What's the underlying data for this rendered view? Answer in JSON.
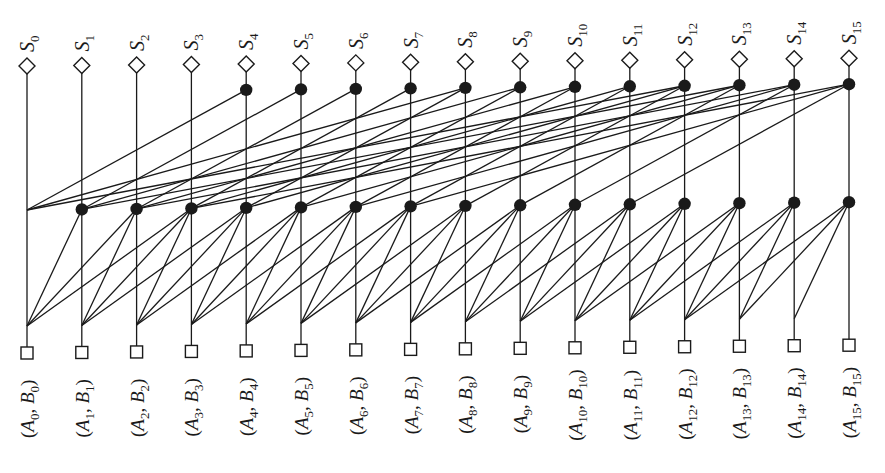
{
  "diagram": {
    "bit_count": 16,
    "layout": {
      "col_x0": 27,
      "col_dx": 54.8,
      "row_y_col0": {
        "sum_label_base": 52,
        "sum_node": 66,
        "level2_node": 92,
        "level1_node": 210,
        "level0_junction": 326,
        "input_node": 353,
        "input_label_top": 366
      },
      "row_y_skew_per_col": -0.52
    },
    "outputs": [
      {
        "name": "S",
        "index": "0"
      },
      {
        "name": "S",
        "index": "1"
      },
      {
        "name": "S",
        "index": "2"
      },
      {
        "name": "S",
        "index": "3"
      },
      {
        "name": "S",
        "index": "4"
      },
      {
        "name": "S",
        "index": "5"
      },
      {
        "name": "S",
        "index": "6"
      },
      {
        "name": "S",
        "index": "7"
      },
      {
        "name": "S",
        "index": "8"
      },
      {
        "name": "S",
        "index": "9"
      },
      {
        "name": "S",
        "index": "10"
      },
      {
        "name": "S",
        "index": "11"
      },
      {
        "name": "S",
        "index": "12"
      },
      {
        "name": "S",
        "index": "13"
      },
      {
        "name": "S",
        "index": "14"
      },
      {
        "name": "S",
        "index": "15"
      }
    ],
    "inputs": [
      {
        "a": "A",
        "b": "B",
        "index": "0"
      },
      {
        "a": "A",
        "b": "B",
        "index": "1"
      },
      {
        "a": "A",
        "b": "B",
        "index": "2"
      },
      {
        "a": "A",
        "b": "B",
        "index": "3"
      },
      {
        "a": "A",
        "b": "B",
        "index": "4"
      },
      {
        "a": "A",
        "b": "B",
        "index": "5"
      },
      {
        "a": "A",
        "b": "B",
        "index": "6"
      },
      {
        "a": "A",
        "b": "B",
        "index": "7"
      },
      {
        "a": "A",
        "b": "B",
        "index": "8"
      },
      {
        "a": "A",
        "b": "B",
        "index": "9"
      },
      {
        "a": "A",
        "b": "B",
        "index": "10"
      },
      {
        "a": "A",
        "b": "B",
        "index": "11"
      },
      {
        "a": "A",
        "b": "B",
        "index": "12"
      },
      {
        "a": "A",
        "b": "B",
        "index": "13"
      },
      {
        "a": "A",
        "b": "B",
        "index": "14"
      },
      {
        "a": "A",
        "b": "B",
        "index": "15"
      }
    ],
    "level1": {
      "description": "prefix node at column j combines spans from columns j-1, j-2, j-3",
      "node_columns": [
        1,
        2,
        3,
        4,
        5,
        6,
        7,
        8,
        9,
        10,
        11,
        12,
        13,
        14,
        15
      ],
      "fan_in_offsets": [
        1,
        2,
        3
      ],
      "junction_columns": [
        0,
        1,
        2,
        3,
        4,
        5,
        6,
        7,
        8,
        9,
        10,
        11,
        12,
        13,
        14
      ]
    },
    "level2": {
      "description": "prefix node at column j combines level-1 results from columns j-4, j-8, j-12",
      "node_columns": [
        4,
        5,
        6,
        7,
        8,
        9,
        10,
        11,
        12,
        13,
        14,
        15
      ],
      "fan_in_offsets": [
        4,
        8,
        12
      ],
      "junction_columns": [
        0
      ]
    },
    "symbols": {
      "output_node": "diamond",
      "input_node": "square",
      "prefix_node": "filled-circle"
    },
    "colors": {
      "ink": "#1a1a1a",
      "background": "#ffffff"
    }
  }
}
